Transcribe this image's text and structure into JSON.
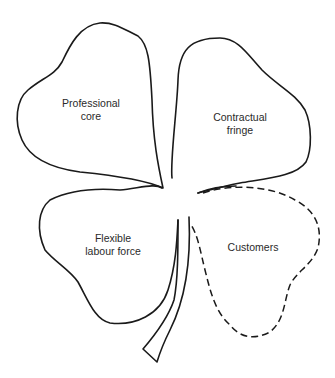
{
  "diagram": {
    "leaves": [
      {
        "id": "professional-core",
        "line1": "Professional",
        "line2": "core",
        "style": "solid"
      },
      {
        "id": "contractual-fringe",
        "line1": "Contractual",
        "line2": "fringe",
        "style": "solid"
      },
      {
        "id": "flexible-labour-force",
        "line1": "Flexible",
        "line2": "labour force",
        "style": "solid"
      },
      {
        "id": "customers",
        "line1": "Customers",
        "line2": "",
        "style": "dashed"
      }
    ],
    "colors": {
      "stroke": "#1a1a1a",
      "text": "#2a2a2a",
      "background": "#ffffff"
    }
  }
}
